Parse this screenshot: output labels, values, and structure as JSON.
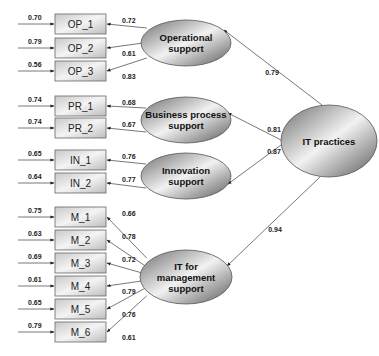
{
  "diagram": {
    "type": "structural-equation-model",
    "second_order_factor": {
      "id": "itp",
      "label": "IT practices"
    },
    "factors": [
      {
        "id": "op",
        "label_lines": [
          "Operational",
          "support"
        ],
        "loading_from_itp": "0.79",
        "indicators": [
          {
            "label": "OP_1",
            "error": "0.70",
            "loading": "0.72"
          },
          {
            "label": "OP_2",
            "error": "0.79",
            "loading": "0.61"
          },
          {
            "label": "OP_3",
            "error": "0.56",
            "loading": "0.83"
          }
        ]
      },
      {
        "id": "pr",
        "label_lines": [
          "Business process",
          "support"
        ],
        "loading_from_itp": "0.81",
        "indicators": [
          {
            "label": "PR_1",
            "error": "0.74",
            "loading": "0.68"
          },
          {
            "label": "PR_2",
            "error": "0.74",
            "loading": "0.67"
          }
        ]
      },
      {
        "id": "in",
        "label_lines": [
          "Innovation",
          "support"
        ],
        "loading_from_itp": "0.87",
        "indicators": [
          {
            "label": "IN_1",
            "error": "0.65",
            "loading": "0.76"
          },
          {
            "label": "IN_2",
            "error": "0.64",
            "loading": "0.77"
          }
        ]
      },
      {
        "id": "m",
        "label_lines": [
          "IT for",
          "management",
          "support"
        ],
        "loading_from_itp": "0.94",
        "indicators": [
          {
            "label": "M_1",
            "error": "0.75",
            "loading": "0.66"
          },
          {
            "label": "M_2",
            "error": "0.63",
            "loading": "0.78"
          },
          {
            "label": "M_3",
            "error": "0.69",
            "loading": "0.72"
          },
          {
            "label": "M_4",
            "error": "0.61",
            "loading": "0.79"
          },
          {
            "label": "M_5",
            "error": "0.65",
            "loading": "0.76"
          },
          {
            "label": "M_6",
            "error": "0.79",
            "loading": "0.61"
          }
        ]
      }
    ],
    "colors": {
      "line": "#555555",
      "text": "#222222",
      "box_border": "#666666",
      "ellipse_border": "#555555"
    }
  }
}
